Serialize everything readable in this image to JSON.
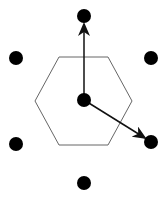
{
  "diagram": {
    "type": "hexagonal-lattice-unit-cell",
    "colors": {
      "background": "#ffffff",
      "dot": "#000000",
      "hexagon": "#666666",
      "arrow": "#111111"
    },
    "hexagon": {
      "points": [
        [
          35,
          101
        ],
        [
          59,
          57
        ],
        [
          108,
          57
        ],
        [
          132,
          101
        ],
        [
          108,
          145
        ],
        [
          59,
          145
        ]
      ]
    },
    "center_dot": {
      "x": 84,
      "y": 100,
      "r": 7
    },
    "lattice_dots": [
      {
        "id": "top",
        "x": 84,
        "y": 16,
        "r": 7
      },
      {
        "id": "upper-left",
        "x": 16,
        "y": 58,
        "r": 7
      },
      {
        "id": "upper-right",
        "x": 151,
        "y": 58,
        "r": 7
      },
      {
        "id": "lower-left",
        "x": 16,
        "y": 144,
        "r": 7
      },
      {
        "id": "lower-right",
        "x": 151,
        "y": 142,
        "r": 7
      },
      {
        "id": "bottom",
        "x": 84,
        "y": 183,
        "r": 7
      }
    ],
    "vectors": [
      {
        "id": "a1",
        "from": [
          84,
          100
        ],
        "to": [
          84,
          24
        ]
      },
      {
        "id": "a2",
        "from": [
          84,
          100
        ],
        "to": [
          145,
          138
        ]
      }
    ]
  }
}
